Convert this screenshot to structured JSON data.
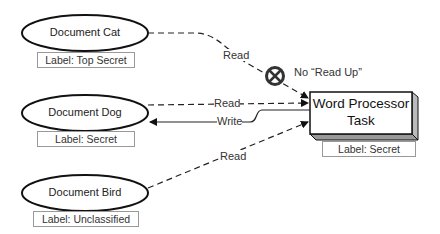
{
  "documents": [
    {
      "name": "Document Cat",
      "label": "Label: Top Secret"
    },
    {
      "name": "Document Dog",
      "label": "Label: Secret"
    },
    {
      "name": "Document Bird",
      "label": "Label: Unclassified"
    }
  ],
  "task": {
    "line1": "Word Processor",
    "line2": "Task",
    "label": "Label: Secret"
  },
  "edges": {
    "cat_read": "Read",
    "dog_read": "Read",
    "dog_write": "Write",
    "bird_read": "Read"
  },
  "prohibition": {
    "icon": "no-entry-icon",
    "text": "No “Read Up”"
  }
}
